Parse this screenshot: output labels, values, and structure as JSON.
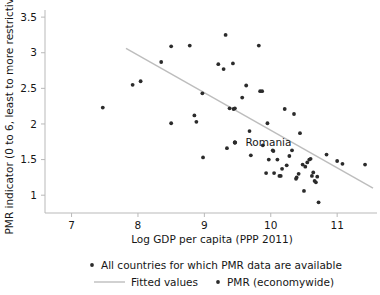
{
  "chart_data": {
    "type": "scatter",
    "title": "",
    "xlabel": "Log GDP per capita (PPP 2011)",
    "ylabel": "PMR indicator (0 to 6, least to more restrictive)",
    "xlim": [
      6.6,
      11.6
    ],
    "ylim": [
      0.75,
      3.6
    ],
    "xticks": [
      7,
      8,
      9,
      10,
      11
    ],
    "xticklabels": [
      "7",
      "8",
      "9",
      "10",
      "11"
    ],
    "yticks": [
      1,
      1.5,
      2,
      2.5,
      3,
      3.5
    ],
    "yticklabels": [
      "1",
      "1.5",
      "2",
      "2.5",
      "3",
      "3.5"
    ],
    "grid": false,
    "marker_color": "#2b2b2b",
    "line_color": "#bdbdbd",
    "axis_color": "#b9b9b9",
    "series": [
      {
        "name": "All countries for which PMR data are available",
        "type": "scatter",
        "points": [
          [
            7.47,
            2.23
          ],
          [
            7.92,
            2.55
          ],
          [
            8.04,
            2.6
          ],
          [
            8.35,
            2.87
          ],
          [
            8.5,
            3.09
          ],
          [
            8.5,
            2.01
          ],
          [
            8.78,
            3.1
          ],
          [
            8.85,
            2.12
          ],
          [
            8.88,
            2.03
          ],
          [
            8.97,
            2.43
          ],
          [
            8.98,
            1.53
          ],
          [
            9.21,
            2.84
          ],
          [
            9.29,
            2.77
          ],
          [
            9.32,
            3.25
          ],
          [
            9.34,
            1.66
          ],
          [
            9.38,
            2.22
          ],
          [
            9.43,
            2.85
          ],
          [
            9.44,
            2.21
          ],
          [
            9.46,
            2.22
          ],
          [
            9.46,
            1.74
          ],
          [
            9.57,
            2.37
          ],
          [
            9.63,
            2.54
          ],
          [
            9.68,
            1.9
          ],
          [
            9.7,
            1.56
          ],
          [
            9.82,
            3.1
          ],
          [
            9.84,
            2.46
          ],
          [
            9.87,
            2.46
          ],
          [
            9.88,
            1.7
          ],
          [
            9.93,
            1.31
          ],
          [
            9.95,
            2.01
          ],
          [
            9.97,
            1.5
          ],
          [
            10.03,
            1.63
          ],
          [
            10.04,
            1.62
          ],
          [
            10.05,
            1.31
          ],
          [
            10.1,
            1.5
          ],
          [
            10.13,
            1.27
          ],
          [
            10.15,
            1.27
          ],
          [
            10.17,
            1.37
          ],
          [
            10.21,
            2.21
          ],
          [
            10.24,
            1.42
          ],
          [
            10.28,
            1.55
          ],
          [
            10.32,
            1.63
          ],
          [
            10.35,
            2.14
          ],
          [
            10.38,
            1.23
          ],
          [
            10.39,
            1.25
          ],
          [
            10.42,
            1.3
          ],
          [
            10.44,
            1.87
          ],
          [
            10.48,
            1.43
          ],
          [
            10.5,
            1.06
          ],
          [
            10.52,
            1.4
          ],
          [
            10.55,
            1.46
          ],
          [
            10.58,
            1.5
          ],
          [
            10.6,
            1.51
          ],
          [
            10.62,
            1.27
          ],
          [
            10.64,
            1.32
          ],
          [
            10.66,
            1.2
          ],
          [
            10.68,
            1.18
          ],
          [
            10.7,
            1.26
          ],
          [
            10.72,
            0.9
          ],
          [
            10.84,
            1.57
          ],
          [
            11.0,
            1.48
          ],
          [
            11.08,
            1.44
          ],
          [
            11.42,
            1.43
          ]
        ]
      },
      {
        "name": "PMR (economywide)",
        "type": "scatter",
        "points": [
          [
            9.46,
            1.74
          ]
        ]
      },
      {
        "name": "Fitted values",
        "type": "line",
        "endpoints": [
          [
            7.82,
            3.06
          ],
          [
            11.54,
            1.1
          ]
        ]
      }
    ],
    "annotations": [
      {
        "text": "Romania",
        "x": 9.46,
        "y": 1.74,
        "label_x": 9.62,
        "label_y": 1.74
      }
    ],
    "legend": {
      "position": "below-axes",
      "entries": [
        {
          "label": "All countries for which PMR data are available",
          "marker": "dot"
        },
        {
          "label": "Fitted values",
          "marker": "line"
        },
        {
          "label": "PMR (economywide)",
          "marker": "dot"
        }
      ]
    }
  }
}
